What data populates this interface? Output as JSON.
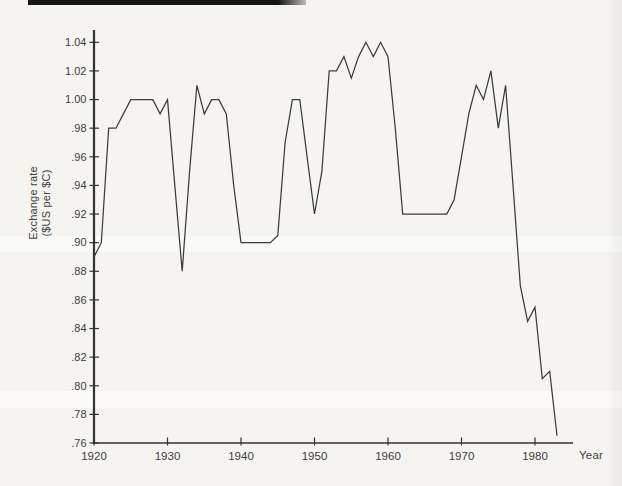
{
  "decorations": {
    "background_color": "#f5f4f1",
    "top_bar_color": "#161616",
    "axis_color": "#333333",
    "text_color": "#404040",
    "line_color": "#3c3c3c"
  },
  "chart_data": {
    "type": "line",
    "title": "",
    "xlabel": "Year",
    "ylabel_line1": "Exchange rate",
    "ylabel_line2": "($US per $C)",
    "grid": false,
    "legend": "none",
    "xlim": [
      1920,
      1985
    ],
    "ylim": [
      0.76,
      1.04
    ],
    "x_ticks": [
      1920,
      1930,
      1940,
      1950,
      1960,
      1970,
      1980
    ],
    "y_ticks": [
      1.04,
      1.02,
      1.0,
      0.98,
      0.96,
      0.94,
      0.92,
      0.9,
      0.88,
      0.86,
      0.84,
      0.82,
      0.8,
      0.78,
      0.76
    ],
    "y_tick_labels": [
      "1.04",
      "1.02",
      "1.00",
      ".98",
      ".96",
      ".94",
      ".92",
      ".90",
      ".88",
      ".86",
      ".84",
      ".82",
      ".80",
      ".78",
      ".76"
    ],
    "years": [
      1920,
      1921,
      1922,
      1923,
      1924,
      1925,
      1926,
      1927,
      1928,
      1929,
      1930,
      1931,
      1932,
      1933,
      1934,
      1935,
      1936,
      1937,
      1938,
      1939,
      1940,
      1941,
      1942,
      1943,
      1944,
      1945,
      1946,
      1947,
      1948,
      1949,
      1950,
      1951,
      1952,
      1953,
      1954,
      1955,
      1956,
      1957,
      1958,
      1959,
      1960,
      1961,
      1962,
      1963,
      1964,
      1965,
      1966,
      1967,
      1968,
      1969,
      1970,
      1971,
      1972,
      1973,
      1974,
      1975,
      1976,
      1977,
      1978,
      1979,
      1980,
      1981,
      1982,
      1983
    ],
    "values": [
      0.89,
      0.9,
      0.98,
      0.98,
      0.99,
      1.0,
      1.0,
      1.0,
      1.0,
      0.99,
      1.0,
      0.94,
      0.88,
      0.95,
      1.01,
      0.99,
      1.0,
      1.0,
      0.99,
      0.94,
      0.9,
      0.9,
      0.9,
      0.9,
      0.9,
      0.905,
      0.97,
      1.0,
      1.0,
      0.96,
      0.92,
      0.95,
      1.02,
      1.02,
      1.03,
      1.015,
      1.03,
      1.04,
      1.03,
      1.04,
      1.03,
      0.98,
      0.92,
      0.92,
      0.92,
      0.92,
      0.92,
      0.92,
      0.92,
      0.93,
      0.96,
      0.99,
      1.01,
      1.0,
      1.02,
      0.98,
      1.01,
      0.94,
      0.87,
      0.845,
      0.855,
      0.805,
      0.81,
      0.765
    ]
  }
}
